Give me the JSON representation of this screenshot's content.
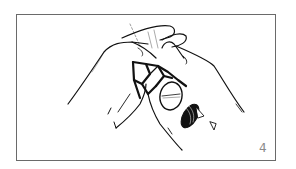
{
  "figure": {
    "step_number": "4",
    "colors": {
      "border": "#6a6a6a",
      "ink": "#111111",
      "background": "#ffffff",
      "number": "#8a8a8a"
    }
  }
}
